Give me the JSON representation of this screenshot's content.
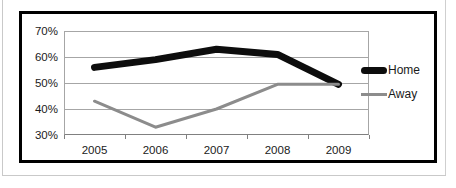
{
  "chart_data": {
    "type": "line",
    "title": "",
    "xlabel": "",
    "ylabel": "",
    "x": [
      "2005",
      "2006",
      "2007",
      "2008",
      "2009"
    ],
    "categories": [
      "2005",
      "2006",
      "2007",
      "2008",
      "2009"
    ],
    "ylim": [
      30,
      70
    ],
    "ytick_labels": [
      "70%",
      "60%",
      "50%",
      "40%",
      "30%"
    ],
    "ytick_values": [
      70,
      60,
      50,
      40,
      30
    ],
    "xtick_labels": [
      "2005",
      "2006",
      "2007",
      "2008",
      "2009"
    ],
    "grid": true,
    "legend_position": "right",
    "series": [
      {
        "name": "Home",
        "values": [
          56,
          59,
          63,
          61,
          49.5
        ],
        "color": "#0d0d0d",
        "width": 7
      },
      {
        "name": "Away",
        "values": [
          43,
          33,
          40,
          49.5,
          49.5
        ],
        "color": "#8c8c8c",
        "width": 3
      }
    ]
  },
  "legend": {
    "items": [
      {
        "label": "Home",
        "swatch": "thick-black-line-swatch"
      },
      {
        "label": "Away",
        "swatch": "thin-gray-line-swatch"
      }
    ]
  },
  "colors": {
    "home_line": "#0d0d0d",
    "away_line": "#8c8c8c",
    "gridline": "#a6a6a6",
    "frame": "#000000",
    "page_border": "#c9c9c9",
    "text": "#1a1a1a",
    "background": "#ffffff"
  }
}
